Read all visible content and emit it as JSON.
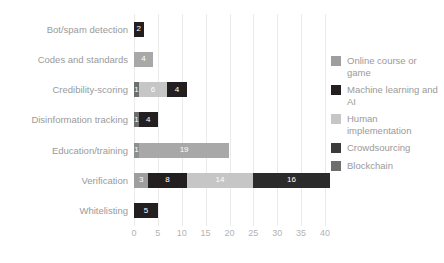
{
  "chart_data": {
    "type": "bar",
    "orientation": "horizontal",
    "stacked": true,
    "title": "",
    "xlabel": "",
    "ylabel": "",
    "xlim": [
      0,
      40
    ],
    "xticks": [
      "0",
      "5",
      "10",
      "15",
      "20",
      "25",
      "30",
      "35",
      "40"
    ],
    "xtick_values": [
      0,
      5,
      10,
      15,
      20,
      25,
      30,
      35,
      40
    ],
    "grid": true,
    "legend_position": "right",
    "categories": [
      "Bot/spam detection",
      "Codes and standards",
      "Credibility-scoring",
      "Disinformation tracking",
      "Education/training",
      "Verification",
      "Whitelisting"
    ],
    "series": [
      {
        "name": "Online course or game",
        "color": "#9e9e9e",
        "values": [
          0,
          4,
          0,
          0,
          19,
          3,
          0
        ]
      },
      {
        "name": "Machine learning and AI",
        "color": "#231f20",
        "values": [
          2,
          0,
          4,
          4,
          0,
          8,
          5
        ]
      },
      {
        "name": "Human implementation",
        "color": "#c6c6c6",
        "values": [
          0,
          0,
          6,
          0,
          0,
          14,
          0
        ]
      },
      {
        "name": "Crowdsourcing",
        "color": "#3b3b3b",
        "values": [
          0,
          0,
          0,
          0,
          0,
          16,
          0
        ]
      },
      {
        "name": "Blockchain",
        "color": "#6e6e6e",
        "values": [
          0,
          0,
          1,
          1,
          1,
          0,
          0
        ]
      }
    ],
    "bars": [
      {
        "category": "Bot/spam detection",
        "total": 2,
        "segments": [
          {
            "series": "Machine learning and AI",
            "value": 2,
            "label": "2",
            "color": "#231f20",
            "text_color": "#ffffff"
          }
        ]
      },
      {
        "category": "Codes and standards",
        "total": 4,
        "segments": [
          {
            "series": "Online course or game",
            "value": 4,
            "label": "4",
            "color": "#a8a8a8",
            "text_color": "#ffffff"
          }
        ]
      },
      {
        "category": "Credibility-scoring",
        "total": 11,
        "segments": [
          {
            "series": "Blockchain",
            "value": 1,
            "label": "1",
            "color": "#6e6e6e",
            "text_color": "#ffffff"
          },
          {
            "series": "Human implementation",
            "value": 6,
            "label": "6",
            "color": "#c6c6c6",
            "text_color": "#ffffff"
          },
          {
            "series": "Machine learning and AI",
            "value": 4,
            "label": "4",
            "color": "#231f20",
            "text_color": "#ffffff"
          }
        ]
      },
      {
        "category": "Disinformation tracking",
        "total": 5,
        "segments": [
          {
            "series": "Blockchain",
            "value": 1,
            "label": "1",
            "color": "#6e6e6e",
            "text_color": "#ffffff"
          },
          {
            "series": "Machine learning and AI",
            "value": 4,
            "label": "4",
            "color": "#231f20",
            "text_color": "#ffffff"
          }
        ]
      },
      {
        "category": "Education/training",
        "total": 20,
        "segments": [
          {
            "series": "Blockchain",
            "value": 1,
            "label": "1",
            "color": "#8f8f8f",
            "text_color": "#ffffff"
          },
          {
            "series": "Online course or game",
            "value": 19,
            "label": "19",
            "color": "#a8a8a8",
            "text_color": "#ffffff"
          }
        ]
      },
      {
        "category": "Verification",
        "total": 41,
        "segments": [
          {
            "series": "Online course or game",
            "value": 3,
            "label": "3",
            "color": "#9e9e9e",
            "text_color": "#ffffff"
          },
          {
            "series": "Machine learning and AI",
            "value": 8,
            "label": "8",
            "color": "#231f20",
            "text_color": "#ffffff"
          },
          {
            "series": "Human implementation",
            "value": 14,
            "label": "14",
            "color": "#c6c6c6",
            "text_color": "#ffffff"
          },
          {
            "series": "Crowdsourcing",
            "value": 16,
            "label": "16",
            "color": "#2b2b2b",
            "text_color": "#ffffff"
          }
        ]
      },
      {
        "category": "Whitelisting",
        "total": 5,
        "segments": [
          {
            "series": "Machine learning and AI",
            "value": 5,
            "label": "5",
            "color": "#231f20",
            "text_color": "#ffffff"
          }
        ]
      }
    ],
    "legend": [
      {
        "label": "Online course or game",
        "color": "#9e9e9e"
      },
      {
        "label": "Machine learning and AI",
        "color": "#231f20"
      },
      {
        "label": "Human implementation",
        "color": "#c6c6c6"
      },
      {
        "label": "Crowdsourcing",
        "color": "#3b3b3b"
      },
      {
        "label": "Blockchain",
        "color": "#6e6e6e"
      }
    ]
  }
}
